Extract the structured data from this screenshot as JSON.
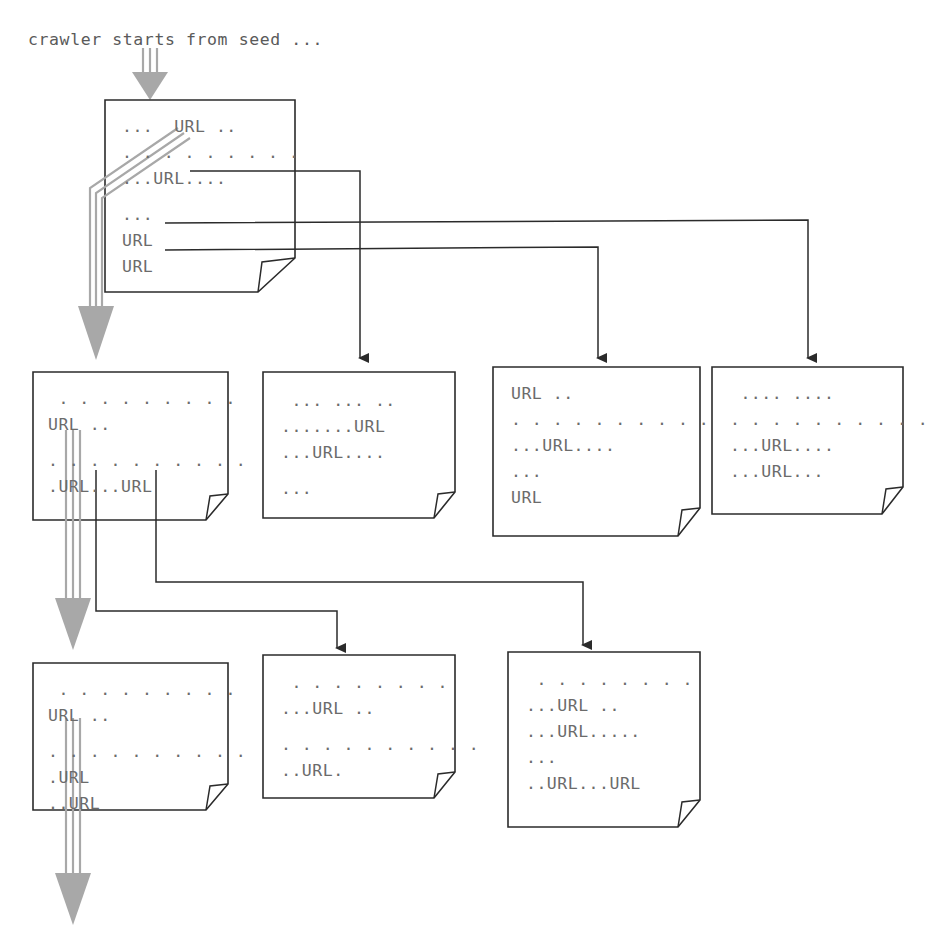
{
  "diagram": {
    "title": "crawler starts from seed ...",
    "type": "web-crawl-flow",
    "colors": {
      "page_background": "#ffffff",
      "document_outline": "#2b2b2b",
      "document_fill": "#ffffff",
      "link_line": "#2b2b2b",
      "crawler_path": "#a8a8a8",
      "text": "#6b6b6b"
    },
    "caption": {
      "label": "crawler starts from seed ...",
      "x": 28,
      "y": 30
    },
    "rows": [
      {
        "row": 1,
        "documents": [
          {
            "id": "doc-seed",
            "name": "seed-document",
            "x": 105,
            "y": 100,
            "width": 190,
            "height": 200,
            "lines": [
              "...  URL ..",
              ". . . . . . . . .",
              "...URL....",
              "",
              "...",
              "URL",
              "URL"
            ]
          }
        ]
      },
      {
        "row": 2,
        "documents": [
          {
            "id": "doc-2-1",
            "name": "level2-document-1",
            "x": 33,
            "y": 372,
            "width": 195,
            "height": 162,
            "lines": [
              " . . . . . . . . .",
              "URL ..",
              "",
              ". . . . . . . . . .",
              ".URL...URL"
            ]
          },
          {
            "id": "doc-2-2",
            "name": "level2-document-2",
            "x": 263,
            "y": 372,
            "width": 192,
            "height": 152,
            "lines": [
              " ... ... ..",
              ".......URL",
              "...URL....",
              "",
              "..."
            ]
          },
          {
            "id": "doc-2-3",
            "name": "level2-document-3",
            "x": 493,
            "y": 367,
            "width": 207,
            "height": 172,
            "lines": [
              "URL ..",
              ". . . . . . . . . .",
              "...URL....",
              "...",
              "URL"
            ]
          },
          {
            "id": "doc-2-4",
            "name": "level2-document-4",
            "x": 712,
            "y": 367,
            "width": 191,
            "height": 148,
            "lines": [
              " .... ....",
              ". . . . . . . . . .",
              "...URL....",
              "...URL..."
            ]
          }
        ]
      },
      {
        "row": 3,
        "documents": [
          {
            "id": "doc-3-1",
            "name": "level3-document-1",
            "x": 33,
            "y": 663,
            "width": 195,
            "height": 160,
            "lines": [
              " . . . . . . . . .",
              "URL ..",
              "",
              ". . . . . . . . . .",
              ".URL",
              "..URL"
            ]
          },
          {
            "id": "doc-3-2",
            "name": "level3-document-2",
            "x": 263,
            "y": 655,
            "width": 192,
            "height": 145,
            "lines": [
              " . . . . . . . .",
              "...URL ..",
              "",
              ". . . . . . . . . .",
              "..URL."
            ]
          },
          {
            "id": "doc-3-3",
            "name": "level3-document-3",
            "x": 508,
            "y": 652,
            "width": 192,
            "height": 175,
            "lines": [
              " . . . . . . . .",
              "...URL ..",
              "...URL.....",
              "...",
              "..URL...URL"
            ]
          }
        ]
      }
    ],
    "crawler_path": {
      "name": "crawler-traversal-path",
      "label": "crawler follows first URL of each page",
      "entry_arrow": {
        "x": 150,
        "y_from": 50,
        "y_to": 100
      },
      "segments": [
        {
          "from": "doc-seed first URL",
          "to": "doc-2-1"
        },
        {
          "from": "doc-2-1 first URL",
          "to": "doc-3-1"
        },
        {
          "from": "doc-3-1 first URL",
          "to": "continues below"
        }
      ]
    },
    "links": [
      {
        "name": "link-seed-to-doc-2-2",
        "from": "doc-seed line 3 URL",
        "to": "doc-2-2"
      },
      {
        "name": "link-seed-to-doc-2-4",
        "from": "doc-seed line 6 URL",
        "to": "doc-2-4"
      },
      {
        "name": "link-seed-to-doc-2-3",
        "from": "doc-seed line 7 URL",
        "to": "doc-2-3"
      },
      {
        "name": "link-doc-2-1-to-doc-3-2",
        "from": "doc-2-1 second URL",
        "to": "doc-3-2"
      },
      {
        "name": "link-doc-2-1-to-doc-3-3",
        "from": "doc-2-1 third URL",
        "to": "doc-3-3"
      }
    ]
  }
}
